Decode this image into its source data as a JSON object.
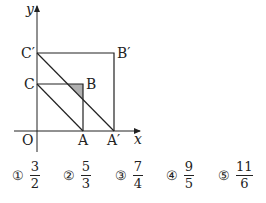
{
  "figure": {
    "axis_labels": {
      "x": "x",
      "y": "y",
      "origin": "O"
    },
    "points": {
      "C_prime": "C′",
      "B_prime": "B′",
      "C": "C",
      "B": "B",
      "A": "A",
      "A_prime": "A′"
    },
    "shaded_color": "#b0b0b0"
  },
  "choices": [
    {
      "marker": "①",
      "num": "3",
      "den": "2"
    },
    {
      "marker": "②",
      "num": "5",
      "den": "3"
    },
    {
      "marker": "③",
      "num": "7",
      "den": "4"
    },
    {
      "marker": "④",
      "num": "9",
      "den": "5"
    },
    {
      "marker": "⑤",
      "num": "11",
      "den": "6"
    }
  ]
}
